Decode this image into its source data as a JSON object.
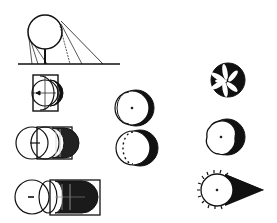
{
  "diagram": {
    "type": "illustration",
    "colors": {
      "ink": "#111111",
      "paper": "#ffffff"
    },
    "figures": [
      {
        "id": "sphere-on-stand-with-rays",
        "label": ""
      },
      {
        "id": "square-circle-arrow",
        "label": ""
      },
      {
        "id": "square-circle-hatched",
        "label": ""
      },
      {
        "id": "square-circle-dark",
        "label": ""
      },
      {
        "id": "crescent-with-dot",
        "label": ""
      },
      {
        "id": "crescent-dashed",
        "label": ""
      },
      {
        "id": "flower-disc",
        "label": ""
      },
      {
        "id": "rough-disc-crescent",
        "label": ""
      },
      {
        "id": "spiky-disc-cone-shadow",
        "label": ""
      }
    ]
  }
}
